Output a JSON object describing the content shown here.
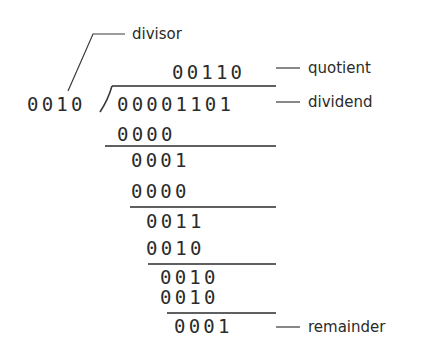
{
  "divisor": "0010",
  "dividend": "00001101",
  "quotient": "00110",
  "steps": [
    {
      "subtrahend": "0000",
      "result": "0001"
    },
    {
      "subtrahend": "0000",
      "result": "0011"
    },
    {
      "subtrahend": "0010",
      "result": "0010"
    },
    {
      "subtrahend": "0010",
      "result": "0001"
    }
  ],
  "remainder": "0001",
  "labels": {
    "divisor": "divisor",
    "quotient": "quotient",
    "dividend": "dividend",
    "remainder": "remainder"
  },
  "colors": {
    "ink": "#2b2b2b",
    "background": "#ffffff"
  }
}
